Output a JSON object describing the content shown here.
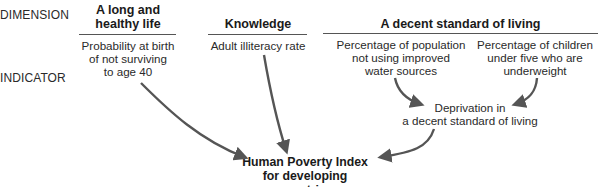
{
  "row_labels": {
    "dimension": "DIMENSION",
    "indicator": "INDICATOR"
  },
  "dimensions": [
    {
      "title_line1": "A long and",
      "title_line2": "healthy life",
      "indicators": [
        {
          "line1": "Probability at birth",
          "line2": "of not surviving",
          "line3": "to age 40"
        }
      ]
    },
    {
      "title_line1": "Knowledge",
      "indicators": [
        {
          "line1": "Adult illiteracy rate"
        }
      ]
    },
    {
      "title_line1": "A decent standard of living",
      "indicators": [
        {
          "line1": "Percentage of population",
          "line2": "not using improved",
          "line3": "water sources"
        },
        {
          "line1": "Percentage of children",
          "line2": "under five who are",
          "line3": "underweight"
        }
      ]
    }
  ],
  "intermediate": {
    "line1": "Deprivation in",
    "line2": "a decent standard of living"
  },
  "result": {
    "line1": "Human Poverty Index",
    "line2": "for developing countries"
  },
  "colors": {
    "arrow": "#555555",
    "rule": "#555555",
    "text": "#1e1e1e"
  }
}
